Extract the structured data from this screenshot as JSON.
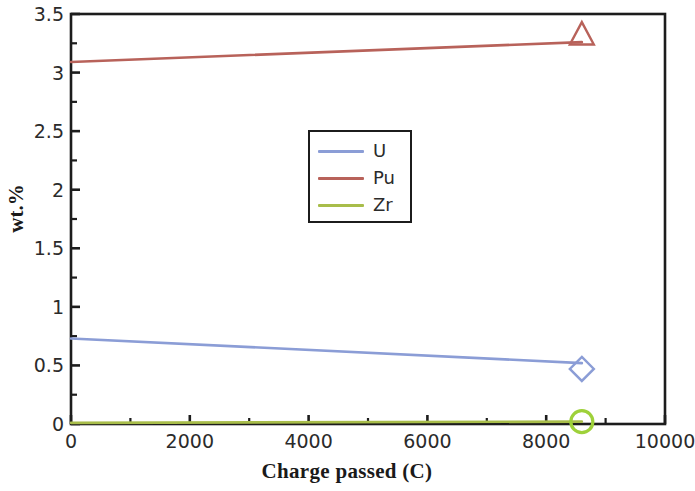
{
  "chart_data": {
    "type": "line",
    "title": "",
    "xlabel": "Charge passed (C)",
    "ylabel": "wt.%",
    "xlim": [
      0,
      10000
    ],
    "ylim": [
      0,
      3.5
    ],
    "xticks": [
      0,
      2000,
      4000,
      6000,
      8000,
      10000
    ],
    "xtick_labels": [
      "0",
      "2000",
      "4000",
      "6000",
      "8000",
      "10000"
    ],
    "yticks": [
      0,
      0.5,
      1,
      1.5,
      2,
      2.5,
      3,
      3.5
    ],
    "ytick_labels": [
      "0",
      "0.5",
      "1",
      "1.5",
      "2",
      "2.5",
      "3",
      "3.5"
    ],
    "x_minor_interval": 1000,
    "y_minor_interval": 0.25,
    "grid": false,
    "legend_position": "center",
    "series": [
      {
        "name": "U",
        "color": "#8b9dd6",
        "marker": "diamond",
        "marker_color": "#8b9dd6",
        "x": [
          0,
          8600
        ],
        "values": [
          0.73,
          0.52
        ],
        "marker_point": {
          "x": 8600,
          "y": 0.47
        }
      },
      {
        "name": "Pu",
        "color": "#b8625a",
        "marker": "triangle",
        "marker_color": "#b8625a",
        "x": [
          0,
          8600
        ],
        "values": [
          3.09,
          3.26
        ],
        "marker_point": {
          "x": 8600,
          "y": 3.32
        }
      },
      {
        "name": "Zr",
        "color": "#a8bd4a",
        "marker": "circle",
        "marker_color": "#9ed13a",
        "x": [
          0,
          8600
        ],
        "values": [
          0.01,
          0.02
        ],
        "marker_point": {
          "x": 8600,
          "y": 0.02
        }
      }
    ]
  },
  "legend": {
    "entries": [
      {
        "label": "U"
      },
      {
        "label": "Pu"
      },
      {
        "label": "Zr"
      }
    ]
  },
  "colors": {
    "axis": "#1c1c1c",
    "text": "#2b2b2b",
    "background": "#ffffff"
  }
}
